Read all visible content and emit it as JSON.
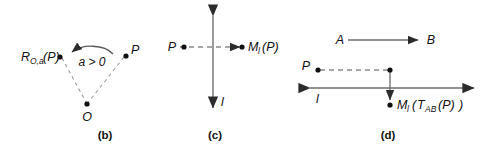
{
  "figure": {
    "background": "#ffffff",
    "ink_color": "#111111",
    "line_color": "#6d6d6d"
  },
  "panels": [
    {
      "id": "b",
      "caption": "(b)",
      "kind": "rotation",
      "labels": {
        "image_point_base": "R",
        "image_point_sub": "O,a",
        "image_point_arg": "(P)",
        "source_point": "P",
        "center_point": "O",
        "angle": "a > 0"
      }
    },
    {
      "id": "c",
      "caption": "(c)",
      "kind": "reflection",
      "labels": {
        "source_point": "P",
        "image_point_base": "M",
        "image_point_sub": "l",
        "image_point_arg": "(P)",
        "axis": "l"
      }
    },
    {
      "id": "d",
      "caption": "(d)",
      "kind": "glide-reflection",
      "labels": {
        "vector_start": "A",
        "vector_end": "B",
        "source_point": "P",
        "axis": "l",
        "image_point_base": "M",
        "image_point_sub": "l",
        "image_open_paren": "(",
        "translation_base": "T",
        "translation_sub": "AB",
        "translation_arg": "(P)",
        "image_close_paren": ")"
      }
    }
  ]
}
